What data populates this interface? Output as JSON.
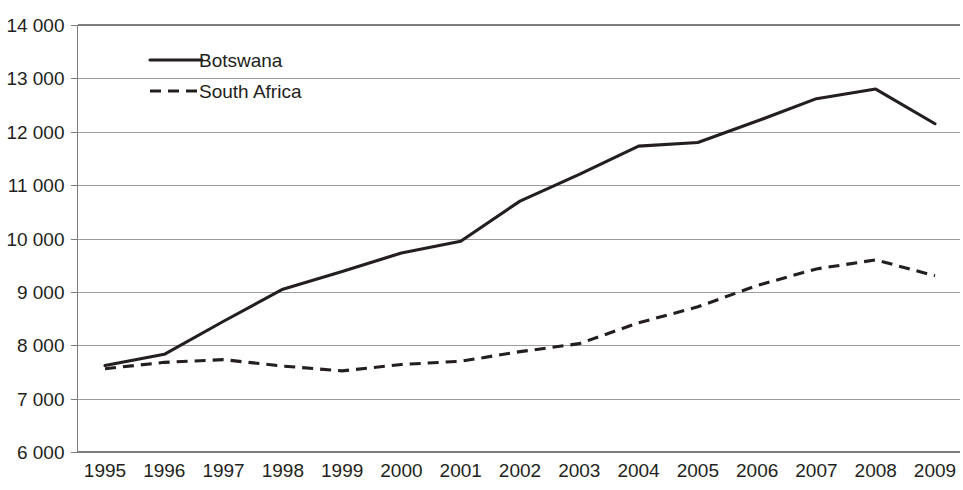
{
  "chart_data": {
    "type": "line",
    "title": "",
    "xlabel": "",
    "ylabel": "",
    "x": [
      1995,
      1996,
      1997,
      1998,
      1999,
      2000,
      2001,
      2002,
      2003,
      2004,
      2005,
      2006,
      2007,
      2008,
      2009
    ],
    "categories": [
      "1995",
      "1996",
      "1997",
      "1998",
      "1999",
      "2000",
      "2001",
      "2002",
      "2003",
      "2004",
      "2005",
      "2006",
      "2007",
      "2008",
      "2009"
    ],
    "series": [
      {
        "name": "Botswana",
        "style": "solid",
        "color": "#231f20",
        "values": [
          7620,
          7830,
          8450,
          9050,
          9380,
          9730,
          9950,
          10700,
          11200,
          11730,
          11800,
          12200,
          12620,
          12800,
          12150
        ]
      },
      {
        "name": "South Africa",
        "style": "dashed",
        "color": "#231f20",
        "values": [
          7560,
          7680,
          7730,
          7610,
          7520,
          7640,
          7700,
          7880,
          8030,
          8420,
          8720,
          9120,
          9430,
          9600,
          9300
        ]
      }
    ],
    "ylim": [
      6000,
      14000
    ],
    "ytick_step": 1000,
    "ytick_labels": [
      "14 000",
      "13 000",
      "12 000",
      "11 000",
      "10 000",
      "9 000",
      "8 000",
      "7 000",
      "6 000"
    ],
    "ytick_values": [
      14000,
      13000,
      12000,
      11000,
      10000,
      9000,
      8000,
      7000,
      6000
    ],
    "grid": true,
    "grid_axis": "y",
    "legend": {
      "position": "top-left-inside",
      "entries": [
        {
          "label": "Botswana",
          "style": "solid"
        },
        {
          "label": "South Africa",
          "style": "dashed"
        }
      ]
    }
  },
  "clipped_title": {
    "text": ""
  }
}
